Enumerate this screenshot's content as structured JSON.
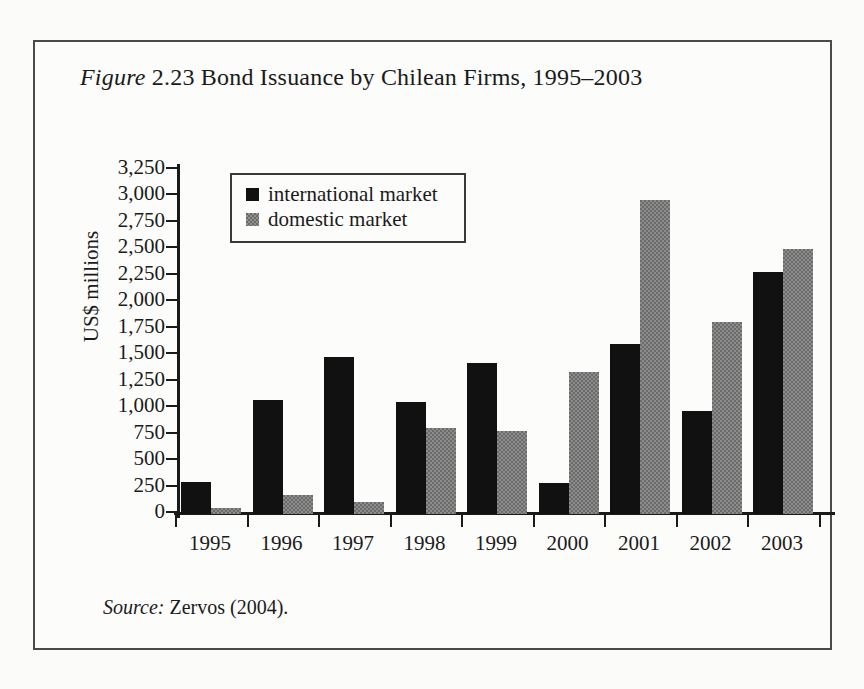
{
  "figure": {
    "label_italic": "Figure",
    "number": "2.23",
    "title_rest": "Bond Issuance by Chilean Firms, 1995–2003",
    "source_label": "Source:",
    "source_text": "Zervos (2004)."
  },
  "colors": {
    "international": "#111111",
    "domestic": "#6b6b6b",
    "axis": "#1a1a1a",
    "frame": "#4a4a4a",
    "background": "#fcfcfb"
  },
  "chart_data": {
    "type": "bar",
    "title": "Figure 2.23 Bond Issuance by Chilean Firms, 1995–2003",
    "xlabel": "",
    "ylabel": "US$ millions",
    "categories": [
      "1995",
      "1996",
      "1997",
      "1998",
      "1999",
      "2000",
      "2001",
      "2002",
      "2003"
    ],
    "series": [
      {
        "name": "international market",
        "color": "#111111",
        "values": [
          300,
          1080,
          1480,
          1060,
          1430,
          290,
          1610,
          970,
          2290
        ]
      },
      {
        "name": "domestic market",
        "color": "#6b6b6b",
        "values": [
          60,
          180,
          110,
          810,
          780,
          1340,
          2970,
          1810,
          2500
        ]
      }
    ],
    "ylim": [
      0,
      3250
    ],
    "ytick_values": [
      0,
      250,
      500,
      750,
      1000,
      1250,
      1500,
      1750,
      2000,
      2250,
      2500,
      2750,
      3000,
      3250
    ],
    "ytick_labels": [
      "0",
      "250",
      "500",
      "750",
      "1,000",
      "1,250",
      "1,500",
      "1,750",
      "2,000",
      "2,250",
      "2,500",
      "2,750",
      "3,000",
      "3,250"
    ],
    "grid": false,
    "legend_position": "upper-left-inside",
    "legend_entries": [
      "international market",
      "domestic market"
    ],
    "source": "Source: Zervos (2004)."
  }
}
